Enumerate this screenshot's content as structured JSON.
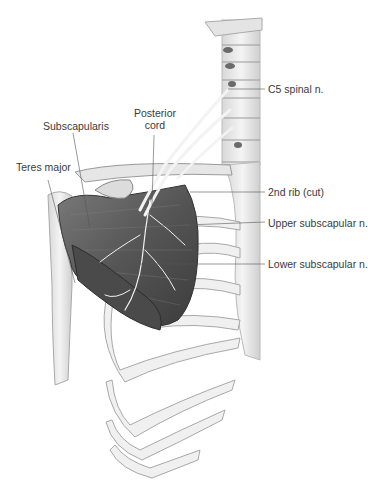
{
  "figure": {
    "labels": {
      "c5": "C5 spinal n.",
      "posterior_cord_1": "Posterior",
      "posterior_cord_2": "cord",
      "subscapularis": "Subscapularis",
      "teres_major": "Teres major",
      "second_rib": "2nd rib (cut)",
      "upper_subscapular": "Upper subscapular n.",
      "lower_subscapular": "Lower subscapular n."
    },
    "colors": {
      "bone": "#eeeeee",
      "bone_shade": "#c9c9c9",
      "muscle": "#5e5e5e",
      "muscle_dark": "#3f3f3f",
      "nerve": "#f2f2f2",
      "leader": "#555555",
      "text": "#3a3a3a"
    }
  }
}
